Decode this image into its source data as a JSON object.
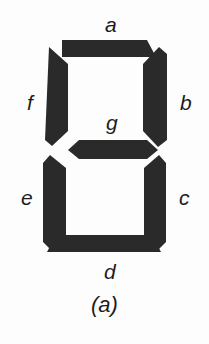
{
  "figure": {
    "caption": "(a)",
    "background_color": "#fdfdfd",
    "segment_color": "#2b2a2a",
    "label_color": "#1d1c1c"
  },
  "segments": [
    {
      "id": "a",
      "label": "a",
      "name": "segment-a-top",
      "position": "top",
      "state": "on"
    },
    {
      "id": "b",
      "label": "b",
      "name": "segment-b-top-right",
      "position": "top-right",
      "state": "on"
    },
    {
      "id": "c",
      "label": "c",
      "name": "segment-c-bottom-right",
      "position": "bottom-right",
      "state": "on"
    },
    {
      "id": "d",
      "label": "d",
      "name": "segment-d-bottom",
      "position": "bottom",
      "state": "on"
    },
    {
      "id": "e",
      "label": "e",
      "name": "segment-e-bottom-left",
      "position": "bottom-left",
      "state": "on"
    },
    {
      "id": "f",
      "label": "f",
      "name": "segment-f-top-left",
      "position": "top-left",
      "state": "on"
    },
    {
      "id": "g",
      "label": "g",
      "name": "segment-g-middle",
      "position": "middle",
      "state": "on"
    }
  ]
}
